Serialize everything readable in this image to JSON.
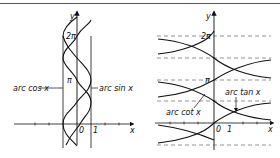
{
  "figure": {
    "left_panel": {
      "axis_x_label": "x",
      "axis_y_label": "y",
      "tick_two_pi": "2π",
      "tick_pi": "π",
      "tick_zero": "0",
      "tick_one": "1",
      "curve_label_arccos": "arc cos x",
      "curve_label_arcsin": "arc sin x"
    },
    "right_panel": {
      "axis_x_label": "x",
      "axis_y_label": "y",
      "tick_two_pi": "2π",
      "tick_pi": "π",
      "tick_zero": "0",
      "tick_one": "1",
      "curve_label_arccot": "arc cot x",
      "curve_label_arctan": "arc tan x"
    }
  },
  "colors": {
    "stroke": "#111111",
    "dashed": "#777777",
    "background": "#ffffff"
  }
}
